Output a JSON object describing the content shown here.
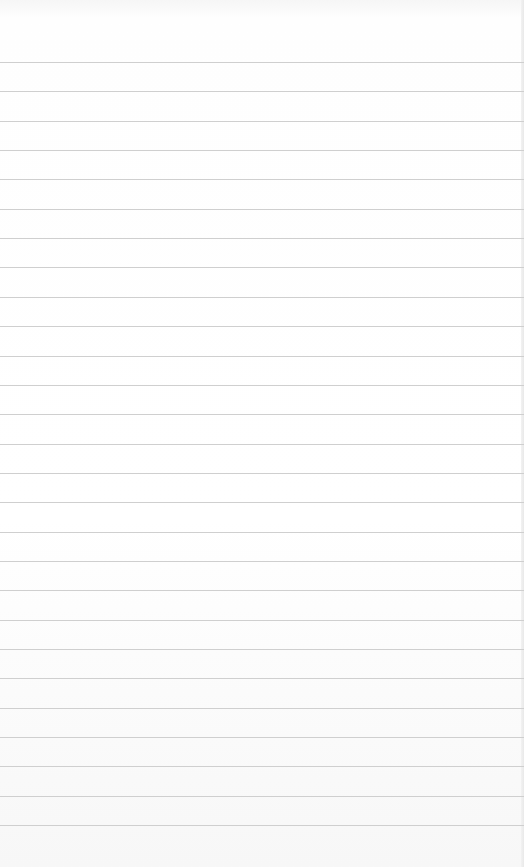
{
  "page": {
    "type": "lined-paper",
    "background_color": "#ffffff",
    "line_color": "#cfcfcf",
    "first_line_y": 62,
    "line_spacing": 29.35,
    "line_count": 27,
    "text": ""
  }
}
